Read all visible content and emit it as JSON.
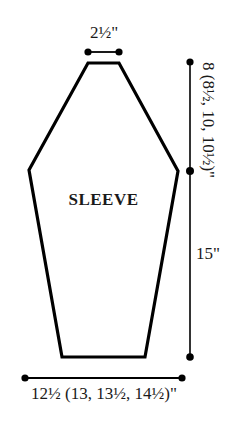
{
  "diagram": {
    "type": "garment-pattern-schematic",
    "piece_label": "SLEEVE",
    "background_color": "#ffffff",
    "line_color": "#000000",
    "text_color": "#1a1a1a",
    "dimensions": {
      "top_width": {
        "label": "2½\"",
        "value_inches": 2.5,
        "position": "top",
        "orientation": "horizontal"
      },
      "bottom_width": {
        "label": "12½ (13, 13½, 14½)\"",
        "values_inches": [
          12.5,
          13,
          13.5,
          14.5
        ],
        "position": "bottom",
        "orientation": "horizontal"
      },
      "upper_height": {
        "label": "8 (8½, 10, 10½)\"",
        "values_inches": [
          8,
          8.5,
          10,
          10.5
        ],
        "position": "right-upper",
        "orientation": "rotated-vertical"
      },
      "lower_height": {
        "label": "15\"",
        "value_inches": 15,
        "position": "right-lower",
        "orientation": "horizontal"
      }
    },
    "shape": {
      "description": "hexagonal sleeve outline",
      "points": "88,63 119,63 178,171 145,357 62,357 29,170",
      "stroke_width": 3.2,
      "fill": "#ffffff"
    },
    "dimension_lines": {
      "top": {
        "x1": 88,
        "y1": 52,
        "x2": 119,
        "y2": 52,
        "dots": [
          [
            88,
            52
          ],
          [
            119,
            52
          ]
        ]
      },
      "right": {
        "x1": 190,
        "y1": 62,
        "x2": 190,
        "y2": 357,
        "dots": [
          [
            190,
            62
          ],
          [
            190,
            171
          ],
          [
            190,
            357
          ]
        ]
      },
      "bottom": {
        "x1": 25,
        "y1": 378,
        "x2": 182,
        "y2": 378,
        "dots": [
          [
            25,
            378
          ],
          [
            182,
            378
          ]
        ]
      },
      "dot_radius": 3.6,
      "stroke_width": 1.6
    }
  }
}
